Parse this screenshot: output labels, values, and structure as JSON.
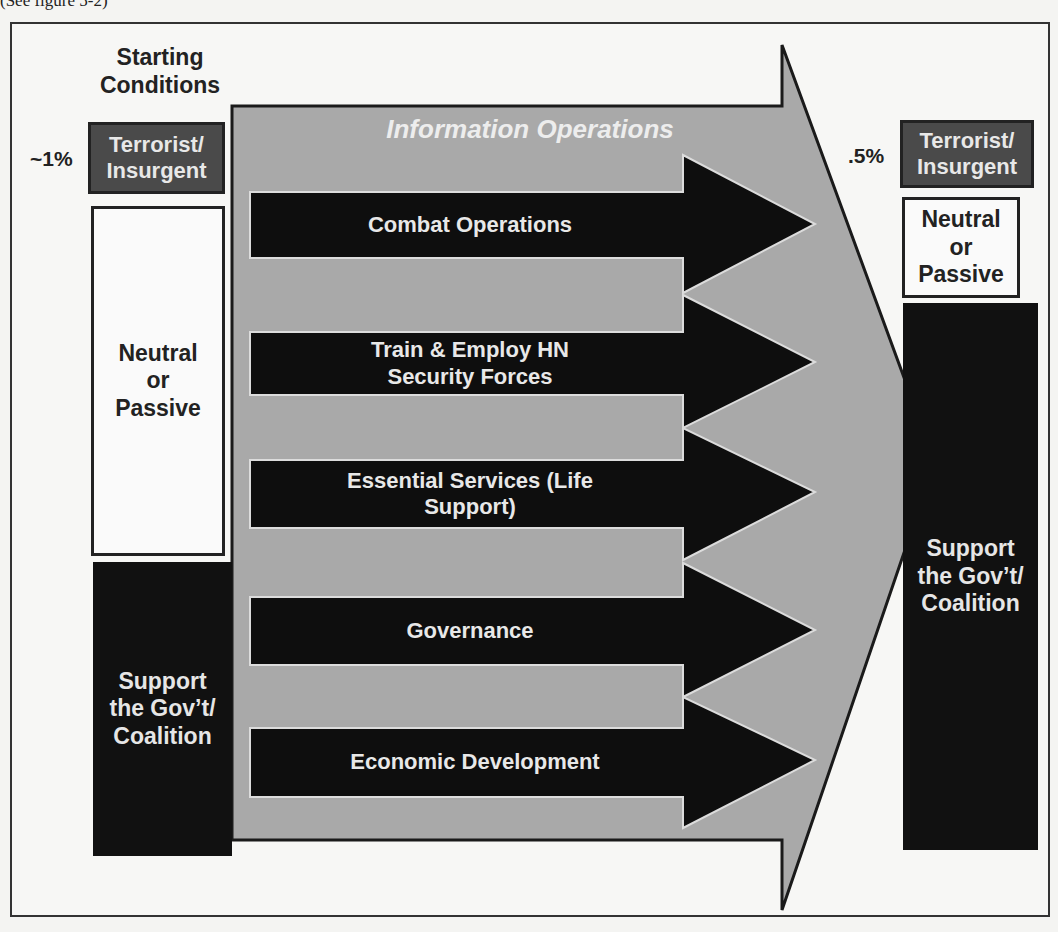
{
  "caption": "(See figure 5-2)",
  "diagram": {
    "left": {
      "title": "Starting Conditions",
      "terrorist_pct": "~1%",
      "terrorist_label": "Terrorist/ Insurgent",
      "neutral_label": "Neutral or Passive",
      "support_label": "Support the Gov’t/ Coalition"
    },
    "center": {
      "title": "Information Operations",
      "lines_of_operation": [
        {
          "label": "Combat Operations"
        },
        {
          "label": "Train & Employ HN Security Forces"
        },
        {
          "label": "Essential Services (Life Support)"
        },
        {
          "label": "Governance"
        },
        {
          "label": "Economic Development"
        }
      ]
    },
    "right": {
      "terrorist_pct": ".5%",
      "terrorist_label": "Terrorist/ Insurgent",
      "neutral_label": "Neutral or Passive",
      "support_label": "Support the Gov’t/ Coalition"
    },
    "colors": {
      "big_arrow_fill": "#a9a9a9",
      "sub_arrow_fill": "#0e0e0e",
      "terrorist_box": "#4a4a4a",
      "neutral_box": "#fafafa",
      "support_box": "#111111"
    }
  }
}
